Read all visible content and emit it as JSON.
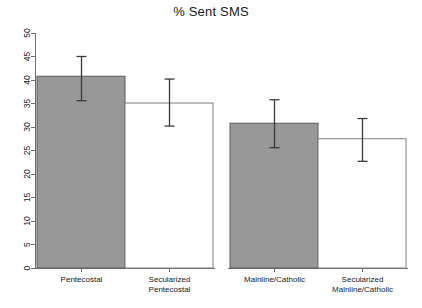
{
  "chart_data": {
    "type": "bar",
    "title": "% Sent SMS",
    "xlabel": "",
    "ylabel": "",
    "ylim": [
      0,
      50
    ],
    "yticks": [
      0,
      5,
      10,
      15,
      20,
      25,
      30,
      35,
      40,
      45,
      50
    ],
    "ytick_labels": [
      "0",
      "5",
      "10",
      "15",
      "20",
      "25",
      "30",
      "35",
      "40",
      "45",
      "50"
    ],
    "grid": false,
    "legend": null,
    "groups": [
      {
        "name": "Pentecostal group",
        "bars": [
          {
            "label_lines": [
              "Pentecostal"
            ],
            "value": 40.8,
            "err_low": 35.6,
            "err_high": 45.0,
            "fill": "#989898",
            "style": "filled"
          },
          {
            "label_lines": [
              "Secularized",
              "Pentecostal"
            ],
            "value": 35.1,
            "err_low": 30.2,
            "err_high": 40.2,
            "fill": "#ffffff",
            "style": "open"
          }
        ]
      },
      {
        "name": "Mainline/Catholic group",
        "bars": [
          {
            "label_lines": [
              "Mainline/Catholic"
            ],
            "value": 30.8,
            "err_low": 25.6,
            "err_high": 35.8,
            "fill": "#989898",
            "style": "filled"
          },
          {
            "label_lines": [
              "Secularized",
              "Mainline/Catholic"
            ],
            "value": 27.5,
            "err_low": 22.7,
            "err_high": 31.8,
            "fill": "#ffffff",
            "style": "open"
          }
        ]
      }
    ],
    "categories": [
      "Pentecostal",
      "Secularized Pentecostal",
      "Mainline/Catholic",
      "Secularized Mainline/Catholic"
    ],
    "values": [
      40.8,
      35.1,
      30.8,
      27.5
    ],
    "error_low": [
      35.6,
      30.2,
      25.6,
      22.7
    ],
    "error_high": [
      45.0,
      40.2,
      35.8,
      31.8
    ],
    "colors": {
      "filled_bar": "#989898",
      "open_bar": "#ffffff",
      "bar_border": "#5a5a5a",
      "axis": "#6e6e6e",
      "error_bar": "#3b3b3b",
      "text": "#1a1a1a",
      "background": "#ffffff"
    }
  }
}
